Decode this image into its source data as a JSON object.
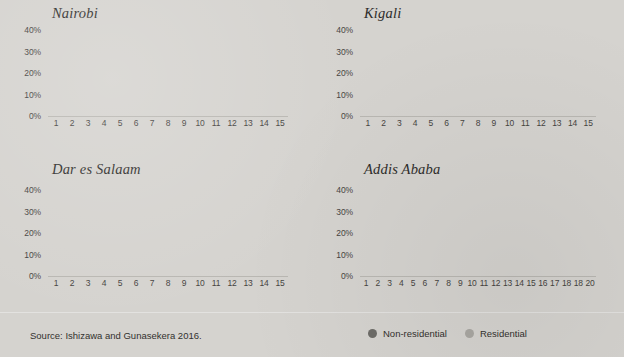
{
  "figure": {
    "source_note": "Source: Ishizawa and Gunasekera 2016.",
    "legend": [
      {
        "label": "Non-residential",
        "color": "#6d6c68",
        "key": "non_residential"
      },
      {
        "label": "Residential",
        "color": "#a9a7a2",
        "key": "residential"
      }
    ],
    "colors": {
      "background": "#d5d3cf",
      "non_residential": "#6d6c68",
      "residential": "#a9a7a2",
      "axis_text": "#46443f",
      "title_text": "#2e2d2b"
    }
  },
  "chart_data": [
    {
      "type": "bar",
      "title": "Nairobi",
      "xlabel": "",
      "ylabel": "",
      "ylim": [
        0,
        40
      ],
      "ytick_labels": [
        "40%",
        "30%",
        "20%",
        "10%",
        "0%"
      ],
      "ytick_values": [
        40,
        30,
        20,
        10,
        0
      ],
      "grid": false,
      "stacked": true,
      "categories": [
        "1",
        "2",
        "3",
        "4",
        "5",
        "6",
        "7",
        "8",
        "9",
        "10",
        "11",
        "12",
        "13",
        "14",
        "15"
      ],
      "series": [
        {
          "name": "Non-residential",
          "values": [
            29.5,
            13.0,
            10.2,
            6.3,
            4.0,
            3.6,
            3.7,
            2.2,
            1.9,
            1.6,
            1.5,
            1.0,
            0.9,
            0.9,
            0.5
          ]
        },
        {
          "name": "Residential",
          "values": [
            1.5,
            2.5,
            2.3,
            1.9,
            1.3,
            1.2,
            1.4,
            1.0,
            0.8,
            0.7,
            0.6,
            0.5,
            0.4,
            0.4,
            0.3
          ]
        }
      ]
    },
    {
      "type": "bar",
      "title": "Kigali",
      "xlabel": "",
      "ylabel": "",
      "ylim": [
        0,
        40
      ],
      "ytick_labels": [
        "40%",
        "30%",
        "20%",
        "10%",
        "0%"
      ],
      "ytick_values": [
        40,
        30,
        20,
        10,
        0
      ],
      "grid": false,
      "stacked": true,
      "categories": [
        "1",
        "2",
        "3",
        "4",
        "5",
        "6",
        "7",
        "8",
        "9",
        "10",
        "11",
        "12",
        "13",
        "14",
        "15"
      ],
      "series": [
        {
          "name": "Non-residential",
          "values": [
            30.4,
            12.0,
            7.0,
            5.1,
            2.4,
            2.2,
            2.0,
            1.1,
            0.8,
            0.8,
            0.9,
            0.7,
            0.5,
            0.4,
            0.3
          ]
        },
        {
          "name": "Residential",
          "values": [
            7.8,
            9.0,
            5.0,
            4.4,
            2.3,
            1.2,
            1.1,
            0.7,
            0.5,
            0.5,
            0.6,
            0.4,
            0.3,
            0.3,
            0.2
          ]
        }
      ]
    },
    {
      "type": "bar",
      "title": "Dar es Salaam",
      "xlabel": "",
      "ylabel": "",
      "ylim": [
        0,
        40
      ],
      "ytick_labels": [
        "40%",
        "30%",
        "20%",
        "10%",
        "0%"
      ],
      "ytick_values": [
        40,
        30,
        20,
        10,
        0
      ],
      "grid": false,
      "stacked": true,
      "categories": [
        "1",
        "2",
        "3",
        "4",
        "5",
        "6",
        "7",
        "8",
        "9",
        "10",
        "11",
        "12",
        "13",
        "14",
        "15"
      ],
      "series": [
        {
          "name": "Non-residential",
          "values": [
            19.3,
            9.6,
            3.0,
            3.1,
            2.8,
            2.6,
            3.0,
            3.6,
            2.8,
            2.2,
            2.2,
            1.9,
            1.7,
            2.0,
            2.0
          ]
        },
        {
          "name": "Residential",
          "values": [
            3.4,
            1.1,
            3.4,
            2.6,
            2.7,
            2.6,
            3.4,
            4.2,
            3.1,
            1.9,
            2.0,
            1.3,
            1.2,
            1.4,
            1.4
          ]
        }
      ]
    },
    {
      "type": "bar",
      "title": "Addis Ababa",
      "xlabel": "",
      "ylabel": "",
      "ylim": [
        0,
        40
      ],
      "ytick_labels": [
        "40%",
        "30%",
        "20%",
        "10%",
        "0%"
      ],
      "ytick_values": [
        40,
        30,
        20,
        10,
        0
      ],
      "grid": false,
      "stacked": true,
      "categories": [
        "1",
        "2",
        "3",
        "4",
        "5",
        "6",
        "7",
        "8",
        "9",
        "10",
        "11",
        "12",
        "13",
        "14",
        "15",
        "16",
        "17",
        "18",
        "18",
        "20"
      ],
      "series": [
        {
          "name": "Non-residential",
          "values": [
            10.8,
            7.1,
            2.6,
            4.1,
            4.4,
            2.4,
            2.5,
            2.7,
            2.4,
            2.5,
            2.0,
            2.4,
            1.5,
            1.3,
            1.1,
            0.5,
            0.5,
            1.2,
            1.0,
            0.4
          ]
        },
        {
          "name": "Residential",
          "values": [
            4.3,
            5.7,
            5.7,
            4.6,
            5.7,
            4.1,
            1.6,
            1.6,
            1.3,
            3.3,
            1.2,
            1.2,
            0.9,
            0.9,
            0.7,
            0.3,
            0.3,
            1.1,
            0.7,
            0.3
          ]
        }
      ]
    }
  ]
}
